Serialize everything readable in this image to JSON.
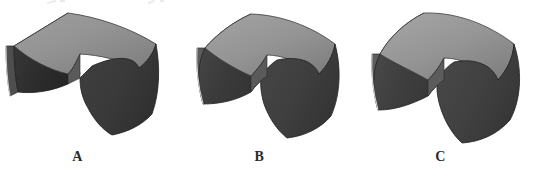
{
  "figure": {
    "caption": "",
    "background_color": "#ffffff",
    "width": 544,
    "height": 178,
    "label_color": "#2a2a2a"
  },
  "palette": {
    "top_face": "#8f8f8f",
    "top_face_light": "#9d9d9d",
    "top_face_shade": "#7c7c7c",
    "left_face_dark": "#2e2e2e",
    "left_face_mid": "#474747",
    "right_face": "#3c3c3c",
    "right_face_mid": "#4a4a4a",
    "inner_face": "#555555",
    "outline": "#1e1e1e",
    "highlight_edge": "#e6e6e6"
  },
  "shapes": [
    {
      "id": "shape-a",
      "label": "A",
      "name": "curved-sheet-solid-a",
      "description": "bent plate with flat angular top and shallow curvature",
      "curvature": "low"
    },
    {
      "id": "shape-b",
      "label": "B",
      "name": "curved-sheet-solid-b",
      "description": "bent plate with moderately curved top surface",
      "curvature": "medium"
    },
    {
      "id": "shape-c",
      "label": "C",
      "name": "curved-sheet-solid-c",
      "description": "bent plate with strongly curved, rounded top surface",
      "curvature": "high"
    }
  ]
}
